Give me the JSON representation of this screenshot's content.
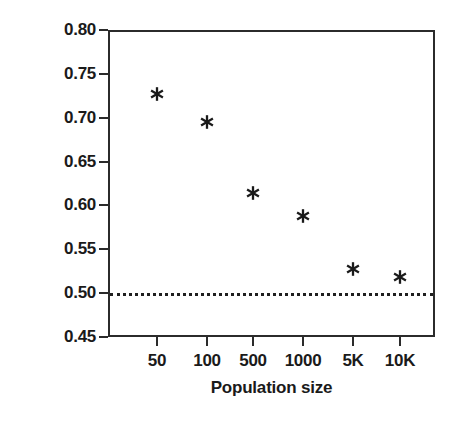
{
  "chart_data": {
    "type": "scatter",
    "title": "",
    "xlabel": "Population size",
    "ylabel": "Average strategy",
    "categories": [
      "50",
      "100",
      "500",
      "1000",
      "5K",
      "10K"
    ],
    "values": [
      0.727,
      0.695,
      0.614,
      0.588,
      0.528,
      0.518
    ],
    "series": [
      {
        "name": "Average strategy",
        "marker": "asterisk",
        "color": "#1a1a1a",
        "values": [
          0.727,
          0.695,
          0.614,
          0.588,
          0.528,
          0.518
        ]
      }
    ],
    "points": [
      {
        "category": "50",
        "value": 0.727
      },
      {
        "category": "100",
        "value": 0.695
      },
      {
        "category": "500",
        "value": 0.614
      },
      {
        "category": "1000",
        "value": 0.588
      },
      {
        "category": "5K",
        "value": 0.528
      },
      {
        "category": "10K",
        "value": 0.518
      }
    ],
    "ylim": [
      0.45,
      0.8
    ],
    "ytick_labels": [
      "0.80",
      "0.75",
      "0.70",
      "0.65",
      "0.60",
      "0.55",
      "0.50",
      "0.45"
    ],
    "ytick_values": [
      0.8,
      0.75,
      0.7,
      0.65,
      0.6,
      0.55,
      0.5,
      0.45
    ],
    "xtick_labels": [
      "50",
      "100",
      "500",
      "1000",
      "5K",
      "10K"
    ],
    "grid": false,
    "legend": false,
    "annotations": [
      {
        "name": "reference-line",
        "kind": "horizontal-dotted-line",
        "value": 0.5,
        "color": "#1f1f1f"
      }
    ],
    "axis_color": "#2b2b2b"
  }
}
